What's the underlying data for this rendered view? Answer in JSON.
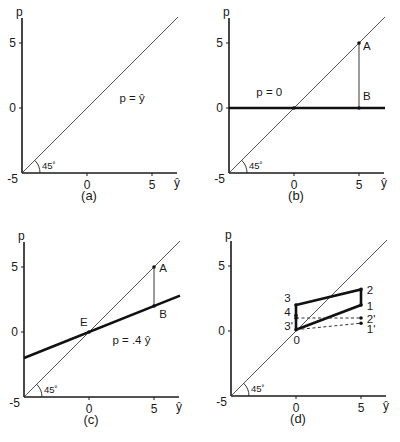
{
  "chart_data": [
    {
      "id": "a",
      "type": "line",
      "caption": "(a)",
      "xlabel": "ŷ",
      "ylabel": "p",
      "xlim": [
        -5,
        7
      ],
      "ylim": [
        -5,
        7
      ],
      "xticks": [
        {
          "value": -5,
          "label": "-5"
        },
        {
          "value": 0,
          "label": "0"
        },
        {
          "value": 5,
          "label": "5"
        }
      ],
      "yticks": [
        {
          "value": 5,
          "label": "5"
        },
        {
          "value": 0,
          "label": "0"
        }
      ],
      "angle_label": "45˚",
      "series": [
        {
          "name": "45-degree line",
          "style": "diag",
          "x": [
            -5,
            7
          ],
          "y": [
            -5,
            7
          ]
        }
      ],
      "points": [],
      "annotations": [
        {
          "text": "p = ŷ",
          "x": 2.5,
          "y": 0.5
        }
      ]
    },
    {
      "id": "b",
      "type": "line",
      "caption": "(b)",
      "xlabel": "ŷ",
      "ylabel": "p",
      "xlim": [
        -5,
        7
      ],
      "ylim": [
        -5,
        7
      ],
      "xticks": [
        {
          "value": -5,
          "label": "-5"
        },
        {
          "value": 0,
          "label": "0"
        },
        {
          "value": 5,
          "label": "5"
        }
      ],
      "yticks": [
        {
          "value": 5,
          "label": "5"
        },
        {
          "value": 0,
          "label": "0"
        }
      ],
      "angle_label": "45˚",
      "series": [
        {
          "name": "45-degree line",
          "style": "diag",
          "x": [
            -5,
            7
          ],
          "y": [
            -5,
            7
          ]
        },
        {
          "name": "p = 0",
          "style": "thick",
          "x": [
            -5,
            7
          ],
          "y": [
            0,
            0
          ]
        },
        {
          "name": "A-B segment",
          "style": "thin",
          "x": [
            5,
            5
          ],
          "y": [
            5,
            0
          ]
        }
      ],
      "points": [
        {
          "label": "",
          "x": 0,
          "y": 0
        },
        {
          "label": "A",
          "x": 5,
          "y": 5,
          "dx": 0.3,
          "dy": -0.5
        },
        {
          "label": "B",
          "x": 5,
          "y": 0,
          "dx": 0.3,
          "dy": 0.6
        }
      ],
      "annotations": [
        {
          "text": "p = 0",
          "x": -2.9,
          "y": 0.9
        }
      ]
    },
    {
      "id": "c",
      "type": "line",
      "caption": "(c)",
      "xlabel": "ŷ",
      "ylabel": "p",
      "xlim": [
        -5,
        7
      ],
      "ylim": [
        -5,
        7
      ],
      "xticks": [
        {
          "value": -5,
          "label": "-5"
        },
        {
          "value": 0,
          "label": "0"
        },
        {
          "value": 5,
          "label": "5"
        }
      ],
      "yticks": [
        {
          "value": 5,
          "label": "5"
        },
        {
          "value": 0,
          "label": "0"
        }
      ],
      "angle_label": "45˚",
      "series": [
        {
          "name": "45-degree line",
          "style": "diag",
          "x": [
            -5,
            7
          ],
          "y": [
            -5,
            7
          ]
        },
        {
          "name": "p = .4 ŷ",
          "style": "thick",
          "x": [
            -5,
            7
          ],
          "y": [
            -2,
            2.8
          ]
        },
        {
          "name": "A-B segment",
          "style": "thin",
          "x": [
            5,
            5
          ],
          "y": [
            5,
            2
          ]
        }
      ],
      "points": [
        {
          "label": "E",
          "x": 0,
          "y": 0,
          "dx": -0.7,
          "dy": 0.45
        },
        {
          "label": "A",
          "x": 5,
          "y": 5,
          "dx": 0.4,
          "dy": -0.35
        },
        {
          "label": "B",
          "x": 5,
          "y": 2,
          "dx": 0.4,
          "dy": -0.9
        }
      ],
      "annotations": [
        {
          "text": "p = .4 ŷ",
          "x": 1.8,
          "y": -0.9
        }
      ]
    },
    {
      "id": "d",
      "type": "line",
      "caption": "(d)",
      "xlabel": "ŷ",
      "ylabel": "p",
      "xlim": [
        -5,
        7
      ],
      "ylim": [
        -5,
        7
      ],
      "xticks": [
        {
          "value": -5,
          "label": "-5"
        },
        {
          "value": 0,
          "label": "0"
        },
        {
          "value": 5,
          "label": "5"
        }
      ],
      "yticks": [
        {
          "value": 5,
          "label": "5"
        },
        {
          "value": 0,
          "label": "0"
        }
      ],
      "angle_label": "45˚",
      "series": [
        {
          "name": "45-degree line",
          "style": "diag",
          "x": [
            -5,
            7
          ],
          "y": [
            -5,
            7
          ]
        },
        {
          "name": "cycle path 0-1-2-3-0",
          "style": "thick",
          "x": [
            0,
            5,
            5,
            0,
            0
          ],
          "y": [
            0.1,
            2,
            3.2,
            2,
            0.1
          ]
        },
        {
          "name": "dashed 0-1'",
          "style": "dash",
          "x": [
            0,
            5
          ],
          "y": [
            0.1,
            0.6
          ]
        },
        {
          "name": "dashed 3'-2'",
          "style": "dash",
          "x": [
            0,
            5
          ],
          "y": [
            1,
            1
          ]
        }
      ],
      "points": [
        {
          "label": "0",
          "x": 0,
          "y": 0.1,
          "dx": -0.2,
          "dy": -1.1
        },
        {
          "label": "1",
          "x": 5,
          "y": 2,
          "dx": 0.45,
          "dy": -0.35
        },
        {
          "label": "2",
          "x": 5,
          "y": 3.2,
          "dx": 0.45,
          "dy": -0.35
        },
        {
          "label": "3",
          "x": 0,
          "y": 2,
          "dx": -0.9,
          "dy": 0.2
        },
        {
          "label": "4",
          "x": 0,
          "y": 1.2,
          "dx": -0.9,
          "dy": -0.05
        },
        {
          "label": "3'",
          "x": 0,
          "y": 1,
          "dx": -0.9,
          "dy": -0.95
        },
        {
          "label": "2'",
          "x": 5,
          "y": 1,
          "dx": 0.45,
          "dy": -0.35
        },
        {
          "label": "1'",
          "x": 5,
          "y": 0.6,
          "dx": 0.45,
          "dy": -0.75
        }
      ],
      "annotations": []
    }
  ]
}
